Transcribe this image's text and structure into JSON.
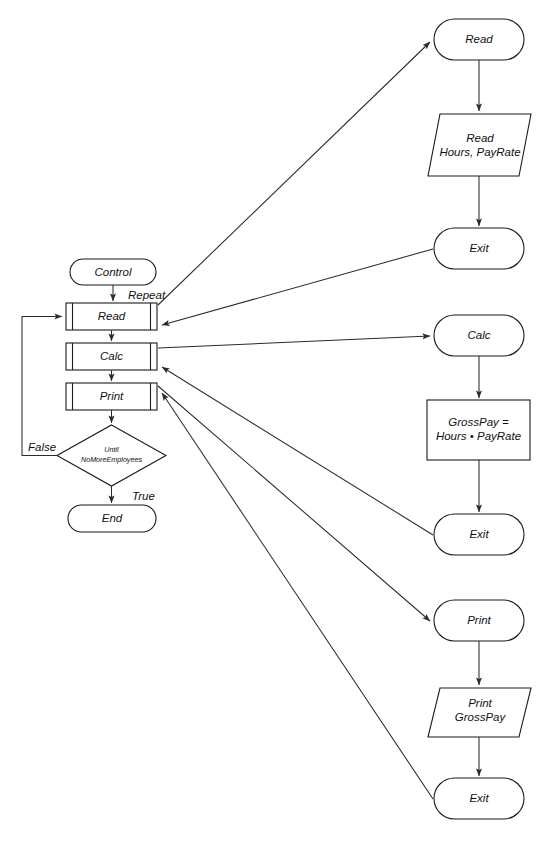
{
  "diagram": {
    "kind": "structured-flowchart",
    "colors": {
      "background": "#ffffff",
      "stroke": "#1a1a1a",
      "connector": "#2b2b2b",
      "text": "#111111"
    },
    "modules": {
      "control": {
        "name": "control-module",
        "nodes": {
          "start": {
            "label": "Control",
            "shape": "terminator"
          },
          "call_read": {
            "label": "Read",
            "shape": "predefined-process"
          },
          "call_calc": {
            "label": "Calc",
            "shape": "predefined-process"
          },
          "call_print": {
            "label": "Print",
            "shape": "predefined-process"
          },
          "decision": {
            "label_line1": "Until",
            "label_line2": "NoMoreEmployees",
            "shape": "decision"
          },
          "end": {
            "label": "End",
            "shape": "terminator"
          }
        },
        "edge_labels": {
          "repeat": "Repeat",
          "false": "False",
          "true": "True"
        }
      },
      "read": {
        "name": "read-module",
        "nodes": {
          "entry": {
            "label": "Read",
            "shape": "terminator"
          },
          "io": {
            "label_line1": "Read",
            "label_line2": "Hours, PayRate",
            "shape": "input-output"
          },
          "exit": {
            "label": "Exit",
            "shape": "terminator"
          }
        }
      },
      "calc": {
        "name": "calc-module",
        "nodes": {
          "entry": {
            "label": "Calc",
            "shape": "terminator"
          },
          "process": {
            "label_line1": "GrossPay =",
            "label_line2": "Hours • PayRate",
            "shape": "process"
          },
          "exit": {
            "label": "Exit",
            "shape": "terminator"
          }
        }
      },
      "print": {
        "name": "print-module",
        "nodes": {
          "entry": {
            "label": "Print",
            "shape": "terminator"
          },
          "io": {
            "label_line1": "Print",
            "label_line2": "GrossPay",
            "shape": "input-output"
          },
          "exit": {
            "label": "Exit",
            "shape": "terminator"
          }
        }
      }
    }
  }
}
